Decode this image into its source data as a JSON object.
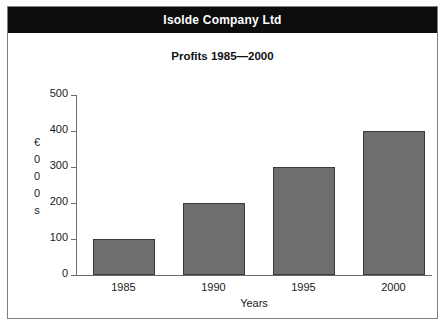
{
  "banner": {
    "company_name": "Isolde Company Ltd",
    "background_color": "#0d0d0d",
    "text_color": "#ffffff"
  },
  "subtitle": "Profits 1985—2000",
  "chart_data": {
    "type": "bar",
    "title": "Profits 1985—2000",
    "categories": [
      "1985",
      "1990",
      "1995",
      "2000"
    ],
    "values": [
      100,
      200,
      300,
      400
    ],
    "xlabel": "Years",
    "ylabel_stacked": [
      "€",
      "0",
      "0",
      "0",
      "s"
    ],
    "ylabel": "€000s",
    "ylim": [
      0,
      500
    ],
    "ytick_labels": [
      "0",
      "100",
      "200",
      "300",
      "400",
      "500"
    ],
    "ytick_values": [
      0,
      100,
      200,
      300,
      400,
      500
    ],
    "grid": false,
    "legend": false,
    "bar_fill_color": "#6e6e6e",
    "bar_border_color": "#3a3a3a",
    "axis_color": "#6d6d6d",
    "frame_border_color": "#808080"
  }
}
